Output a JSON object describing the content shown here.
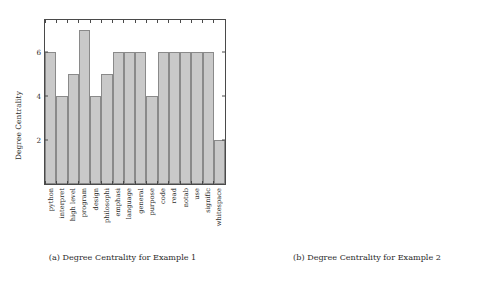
{
  "figure": {
    "subfigures": [
      {
        "key": "a",
        "caption": "(a) Degree Centrality for Example 1",
        "ylabel": "Degree Centrality"
      },
      {
        "key": "b",
        "caption": "(b) Degree Centrality for Example 2",
        "ylabel": "Degree Centrality"
      }
    ]
  },
  "chart_data": [
    {
      "type": "bar",
      "title": "(a) Degree Centrality for Example 1",
      "xlabel": "",
      "ylabel": "Degree Centrality",
      "ylim": [
        0,
        7.45
      ],
      "yticks": [
        2,
        4,
        6
      ],
      "grid": false,
      "legend": null,
      "categories": [
        "python",
        "interpret",
        "high level",
        "program",
        "design",
        "philosophi",
        "emphasi",
        "language",
        "general",
        "purpose",
        "code",
        "read",
        "notab",
        "use",
        "signific",
        "whitespace"
      ],
      "values": [
        6,
        4,
        5,
        7,
        4,
        5,
        6,
        6,
        6,
        4,
        6,
        6,
        6,
        6,
        6,
        2
      ]
    },
    {
      "type": "bar",
      "title": "(b) Degree Centrality for Example 2",
      "xlabel": "",
      "ylabel": "Degree Centrality",
      "ylim": [
        0,
        6.4
      ],
      "yticks": [
        2,
        3,
        4,
        5,
        6
      ],
      "grid": false,
      "legend": null,
      "categories": [
        "python",
        "feature",
        "dynamic",
        "type",
        "system",
        "auto",
        "memory",
        "manage",
        "support",
        "multi",
        "program",
        "paradigm",
        "include",
        "object",
        "imper",
        "function",
        "procedure",
        "large",
        "compre",
        "standard",
        "library"
      ],
      "values": [
        3,
        4,
        5,
        6,
        6,
        6,
        6,
        2,
        3,
        4,
        5,
        6,
        6,
        6,
        6,
        6,
        6,
        6,
        6,
        6,
        2
      ]
    }
  ],
  "style": {
    "bar_fill": "#c9c9c9",
    "bar_border": "#8a8a8a",
    "axis_color": "#4a4a4a",
    "text_color": "#2b2b2b",
    "background": "#ffffff"
  }
}
